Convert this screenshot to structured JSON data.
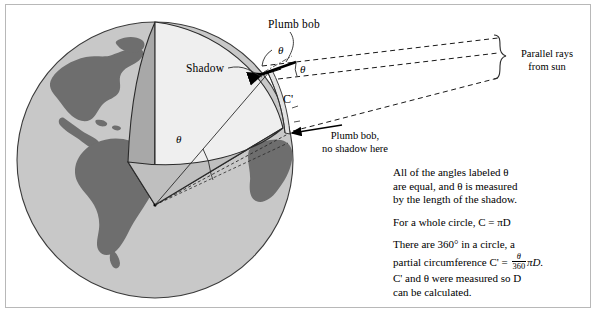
{
  "figure": {
    "type": "diagram",
    "labels": {
      "plumb_bob_top": "Plumb bob",
      "shadow": "Shadow",
      "c_prime": "C'",
      "parallel_rays": "Parallel rays\nfrom sun",
      "parallel_rays_line1": "Parallel rays",
      "parallel_rays_line2": "from sun",
      "plumb_bob_bottom_line1": "Plumb bob,",
      "plumb_bob_bottom_line2": "no shadow here",
      "theta_symbol": "θ"
    },
    "angle_markers": [
      {
        "name": "theta-at-plumb-bob-vertical",
        "symbol": "θ"
      },
      {
        "name": "theta-between-ray-and-surface",
        "symbol": "θ"
      },
      {
        "name": "theta-at-earth-center",
        "symbol": "θ"
      }
    ],
    "colors": {
      "ocean": "#c8c8c8",
      "land": "#6e6e6e",
      "wedge_face_light": "#efefef",
      "wedge_side_dark": "#a8a8a8",
      "wedge_bottom": "#bfbfbf",
      "outline": "#2a2a2a",
      "frame": "#b8b8b8",
      "background": "#ffffff"
    }
  },
  "notes": {
    "para1_line1": "All of the angles labeled θ",
    "para1_line2": "are equal, and θ is measured",
    "para1_line3": "by the length of the shadow.",
    "para2": "For a whole circle, C  =  πD",
    "para3_line1": "There are 360° in a circle, a",
    "para3_pre": "partial circumference C'  =  ",
    "fraction_numerator": "θ",
    "fraction_denominator": "360",
    "para3_post": "πD.",
    "para4_line1": "C' and θ were measured so D",
    "para4_line2": "can be calculated."
  }
}
